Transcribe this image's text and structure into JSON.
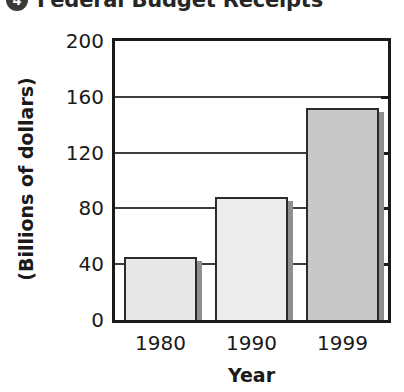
{
  "title": {
    "badge": "4",
    "text": "Federal Budget Receipts"
  },
  "chart_data": {
    "type": "bar",
    "title": "Federal Budget Receipts",
    "categories": [
      "1980",
      "1990",
      "1999"
    ],
    "values": [
      45,
      88,
      152
    ],
    "xlabel": "Year",
    "ylabel": "(Billions of dollars)",
    "ylim": [
      0,
      200
    ],
    "yticks": [
      0,
      40,
      80,
      120,
      160,
      200
    ],
    "grid": true,
    "legend": false,
    "bar_colors": [
      "#e8e8e8",
      "#ececec",
      "#c8c8c8"
    ],
    "bar_outline": "#2b2b2b"
  }
}
